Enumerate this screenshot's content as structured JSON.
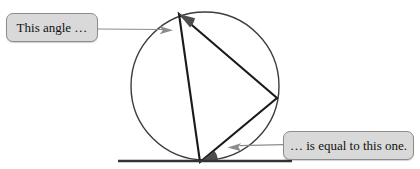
{
  "figure": {
    "background_color": "#ffffff",
    "stroke_color": "#1a1a1a",
    "circle_stroke_color": "#3c3c3c",
    "angle_fill_color": "#4d4d4d",
    "connector_color": "#8c8c8c",
    "callout_fill_color": "#d9d9d9",
    "callout_border_color": "#8c8c8c",
    "circle": {
      "cx": 205,
      "cy": 86,
      "r": 74
    },
    "tangent_line": {
      "x1": 118,
      "y1": 161,
      "x2": 292,
      "y2": 161
    },
    "vertices": {
      "top": {
        "x": 179,
        "y": 14
      },
      "right": {
        "x": 277,
        "y": 98
      },
      "bottom": {
        "x": 200,
        "y": 162
      }
    },
    "triangle_path": "M 179 14 L 277 98 L 200 162 Z",
    "angle_marks": [
      {
        "name": "inscribed-angle-top",
        "vertex": {
          "x": 179,
          "y": 14
        },
        "path": "M 179 14 L 190.1 27.4 A 17.5 17.5 0 0 0 195.1 18.2 Z"
      },
      {
        "name": "tangent-chord-angle-bottom",
        "vertex": {
          "x": 200,
          "y": 162
        },
        "path": "M 200 162 L 214.5 151.1 A 18 18 0 0 1 218 162 Z"
      }
    ],
    "connectors": [
      {
        "name": "left-connector",
        "line": {
          "x1": 98,
          "y1": 29,
          "x2": 162,
          "y2": 29
        },
        "arrow_tip": {
          "x": 172,
          "y": 30
        }
      },
      {
        "name": "right-connector",
        "line": {
          "x1": 283,
          "y1": 145,
          "x2": 240,
          "y2": 145
        },
        "arrow_tip": {
          "x": 227,
          "y": 147
        }
      }
    ]
  },
  "callouts": {
    "left": {
      "text": "This angle …"
    },
    "right": {
      "text": "… is equal to this one."
    }
  }
}
